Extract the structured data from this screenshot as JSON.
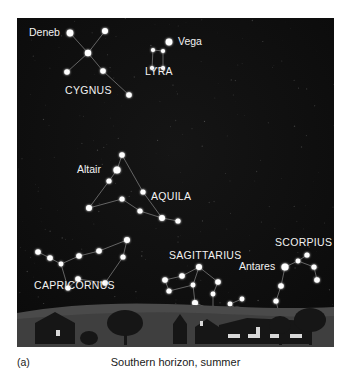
{
  "figure": {
    "panel_label": "(a)",
    "caption": "Southern horizon, summer",
    "sky_color": "#0d0d0d",
    "star_color": "#ffffff",
    "line_color": "#8c8c8c",
    "label_color": "#f2f2f2",
    "ground_color": "#4a4a4a",
    "silhouette_color": "#161616",
    "window_light_color": "#d8d8d8"
  },
  "chart_data": {
    "type": "scatter",
    "title": "Southern horizon, summer",
    "xlabel": "",
    "ylabel": "",
    "xlim": [
      0,
      317
    ],
    "ylim": [
      0,
      329
    ],
    "grid": false,
    "legend": "none",
    "constellations": [
      {
        "name": "CYGNUS",
        "label_x": 48,
        "label_y": 76,
        "stars": [
          {
            "name": "Deneb",
            "x": 53,
            "y": 15,
            "r": 3.4,
            "label": "Deneb",
            "label_x": 12,
            "label_y": 18,
            "label_anchor": "start"
          },
          {
            "name": "cyg-ne",
            "x": 88,
            "y": 13,
            "r": 3.0,
            "label": null
          },
          {
            "name": "cyg-center",
            "x": 71,
            "y": 35,
            "r": 3.2,
            "label": null
          },
          {
            "name": "cyg-w",
            "x": 50,
            "y": 54,
            "r": 2.8,
            "label": null
          },
          {
            "name": "cyg-e",
            "x": 86,
            "y": 53,
            "r": 2.8,
            "label": null
          },
          {
            "name": "Albireo",
            "x": 112,
            "y": 77,
            "r": 2.8,
            "label": null
          }
        ],
        "lines": [
          [
            0,
            2
          ],
          [
            2,
            1
          ],
          [
            3,
            2
          ],
          [
            2,
            4
          ],
          [
            4,
            5
          ]
        ]
      },
      {
        "name": "LYRA",
        "label_x": 128,
        "label_y": 57,
        "stars": [
          {
            "name": "Vega",
            "x": 152,
            "y": 24,
            "r": 3.4,
            "label": "Vega",
            "label_x": 161,
            "label_y": 27,
            "label_anchor": "start"
          },
          {
            "name": "lyr-nw",
            "x": 136,
            "y": 32,
            "r": 2.1,
            "label": null
          },
          {
            "name": "lyr-ne",
            "x": 146,
            "y": 33,
            "r": 2.1,
            "label": null
          },
          {
            "name": "lyr-sw",
            "x": 135,
            "y": 50,
            "r": 2.1,
            "label": null
          },
          {
            "name": "lyr-se",
            "x": 146,
            "y": 50,
            "r": 2.1,
            "label": null
          }
        ],
        "lines": [
          [
            1,
            2
          ],
          [
            1,
            3
          ],
          [
            2,
            4
          ],
          [
            3,
            4
          ]
        ]
      },
      {
        "name": "AQUILA",
        "label_x": 134,
        "label_y": 182,
        "stars": [
          {
            "name": "aql-top",
            "x": 105,
            "y": 137,
            "r": 2.8,
            "label": null
          },
          {
            "name": "Altair",
            "x": 100,
            "y": 152,
            "r": 3.6,
            "label": "Altair",
            "label_x": 60,
            "label_y": 155,
            "label_anchor": "start"
          },
          {
            "name": "aql-2",
            "x": 92,
            "y": 163,
            "r": 2.6,
            "label": null
          },
          {
            "name": "aql-sw",
            "x": 72,
            "y": 190,
            "r": 3.0,
            "label": null
          },
          {
            "name": "aql-mid",
            "x": 105,
            "y": 181,
            "r": 2.6,
            "label": null
          },
          {
            "name": "aql-e",
            "x": 126,
            "y": 174,
            "r": 2.6,
            "label": null
          },
          {
            "name": "aql-low",
            "x": 123,
            "y": 193,
            "r": 2.6,
            "label": null
          },
          {
            "name": "aql-se",
            "x": 145,
            "y": 200,
            "r": 3.0,
            "label": null
          },
          {
            "name": "aql-far",
            "x": 161,
            "y": 203,
            "r": 2.6,
            "label": null
          }
        ],
        "lines": [
          [
            0,
            1
          ],
          [
            1,
            2
          ],
          [
            2,
            3
          ],
          [
            0,
            5
          ],
          [
            5,
            7
          ],
          [
            3,
            4
          ],
          [
            4,
            6
          ],
          [
            6,
            7
          ],
          [
            7,
            8
          ]
        ]
      },
      {
        "name": "CAPRICORNUS",
        "label_x": 17,
        "label_y": 271,
        "stars": [
          {
            "name": "cap-w1",
            "x": 21,
            "y": 234,
            "r": 2.8,
            "label": null
          },
          {
            "name": "cap-w2",
            "x": 33,
            "y": 240,
            "r": 2.8,
            "label": null
          },
          {
            "name": "cap-w3",
            "x": 44,
            "y": 246,
            "r": 2.4,
            "label": null
          },
          {
            "name": "cap-n1",
            "x": 62,
            "y": 238,
            "r": 2.8,
            "label": null
          },
          {
            "name": "cap-n2",
            "x": 82,
            "y": 233,
            "r": 2.8,
            "label": null
          },
          {
            "name": "cap-ne",
            "x": 110,
            "y": 222,
            "r": 3.0,
            "label": null
          },
          {
            "name": "cap-e",
            "x": 106,
            "y": 239,
            "r": 2.6,
            "label": null
          },
          {
            "name": "cap-se",
            "x": 88,
            "y": 265,
            "r": 2.8,
            "label": null
          },
          {
            "name": "cap-s",
            "x": 61,
            "y": 261,
            "r": 2.8,
            "label": null
          },
          {
            "name": "cap-sw",
            "x": 51,
            "y": 270,
            "r": 2.6,
            "label": null
          }
        ],
        "lines": [
          [
            0,
            1
          ],
          [
            1,
            2
          ],
          [
            2,
            3
          ],
          [
            3,
            4
          ],
          [
            4,
            5
          ],
          [
            5,
            6
          ],
          [
            6,
            7
          ],
          [
            7,
            8
          ],
          [
            8,
            9
          ],
          [
            9,
            2
          ]
        ]
      },
      {
        "name": "SAGITTARIUS",
        "label_x": 152,
        "label_y": 241,
        "stars": [
          {
            "name": "sgr-top",
            "x": 182,
            "y": 249,
            "r": 3.0,
            "label": null
          },
          {
            "name": "sgr-w1",
            "x": 165,
            "y": 258,
            "r": 2.8,
            "label": null
          },
          {
            "name": "sgr-w2",
            "x": 148,
            "y": 262,
            "r": 2.8,
            "label": null
          },
          {
            "name": "sgr-w3",
            "x": 152,
            "y": 273,
            "r": 2.6,
            "label": null
          },
          {
            "name": "sgr-mid",
            "x": 176,
            "y": 267,
            "r": 2.4,
            "label": null
          },
          {
            "name": "sgr-e",
            "x": 201,
            "y": 264,
            "r": 2.8,
            "label": null
          },
          {
            "name": "sgr-e2",
            "x": 196,
            "y": 276,
            "r": 2.4,
            "label": null
          },
          {
            "name": "sgr-s1",
            "x": 178,
            "y": 285,
            "r": 3.0,
            "label": null
          },
          {
            "name": "sgr-s2",
            "x": 196,
            "y": 292,
            "r": 2.6,
            "label": null
          }
        ],
        "lines": [
          [
            0,
            1
          ],
          [
            1,
            2
          ],
          [
            2,
            3
          ],
          [
            3,
            4
          ],
          [
            4,
            0
          ],
          [
            0,
            5
          ],
          [
            5,
            6
          ],
          [
            6,
            8
          ],
          [
            4,
            7
          ],
          [
            7,
            8
          ]
        ]
      },
      {
        "name": "SCORPIUS",
        "label_x": 258,
        "label_y": 228,
        "stars": [
          {
            "name": "sco-n1",
            "x": 281,
            "y": 243,
            "r": 2.4,
            "label": null
          },
          {
            "name": "sco-n2",
            "x": 290,
            "y": 237,
            "r": 2.6,
            "label": null
          },
          {
            "name": "sco-n3",
            "x": 297,
            "y": 249,
            "r": 2.6,
            "label": null
          },
          {
            "name": "sco-n4",
            "x": 300,
            "y": 262,
            "r": 2.8,
            "label": null
          },
          {
            "name": "Antares",
            "x": 268,
            "y": 249,
            "r": 3.6,
            "label": "Antares",
            "label_x": 222,
            "label_y": 252,
            "label_anchor": "start"
          },
          {
            "name": "sco-b1",
            "x": 264,
            "y": 268,
            "r": 2.8,
            "label": null
          },
          {
            "name": "sco-b2",
            "x": 259,
            "y": 283,
            "r": 2.6,
            "label": null
          },
          {
            "name": "sco-b3",
            "x": 262,
            "y": 295,
            "r": 2.8,
            "label": null
          },
          {
            "name": "sco-t1",
            "x": 247,
            "y": 301,
            "r": 2.6,
            "label": null
          },
          {
            "name": "sco-t2",
            "x": 232,
            "y": 300,
            "r": 3.0,
            "label": null
          },
          {
            "name": "sco-t3",
            "x": 220,
            "y": 292,
            "r": 2.6,
            "label": null
          },
          {
            "name": "sco-t4",
            "x": 213,
            "y": 286,
            "r": 2.4,
            "label": null
          },
          {
            "name": "sco-t5",
            "x": 225,
            "y": 281,
            "r": 2.4,
            "label": null
          }
        ],
        "lines": [
          [
            1,
            0
          ],
          [
            0,
            2
          ],
          [
            2,
            3
          ],
          [
            4,
            0
          ],
          [
            4,
            5
          ],
          [
            5,
            6
          ],
          [
            6,
            7
          ],
          [
            7,
            8
          ],
          [
            8,
            9
          ],
          [
            9,
            10
          ],
          [
            10,
            11
          ],
          [
            11,
            12
          ]
        ]
      }
    ]
  }
}
